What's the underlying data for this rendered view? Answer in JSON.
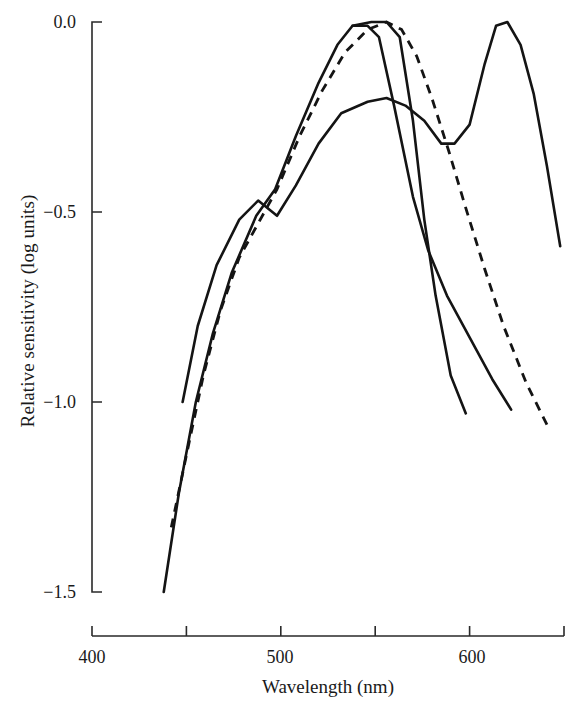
{
  "chart_data": {
    "type": "line",
    "title": "",
    "xlabel": "Wavelength (nm)",
    "ylabel": "Relative sensitivity (log units)",
    "xlim": [
      400,
      650
    ],
    "ylim": [
      -1.5,
      0.0
    ],
    "grid": false,
    "legend": "none",
    "x_ticks": [
      {
        "value": 400,
        "label": "400",
        "major": true
      },
      {
        "value": 450,
        "label": "",
        "major": false
      },
      {
        "value": 500,
        "label": "500",
        "major": true
      },
      {
        "value": 550,
        "label": "",
        "major": false
      },
      {
        "value": 600,
        "label": "600",
        "major": true
      },
      {
        "value": 650,
        "label": "",
        "major": false
      }
    ],
    "y_ticks": [
      {
        "value": 0.0,
        "label": "0.0"
      },
      {
        "value": -0.5,
        "label": "−0.5"
      },
      {
        "value": -1.0,
        "label": "−1.0"
      },
      {
        "value": -1.5,
        "label": "−1.5"
      }
    ],
    "series": [
      {
        "name": "short-wavelength-curve",
        "style": "solid",
        "color": "#141414",
        "points": [
          [
            438,
            -1.5
          ],
          [
            446,
            -1.24
          ],
          [
            455,
            -1.0
          ],
          [
            464,
            -0.82
          ],
          [
            474,
            -0.66
          ],
          [
            487,
            -0.51
          ],
          [
            497,
            -0.44
          ],
          [
            508,
            -0.3
          ],
          [
            520,
            -0.16
          ],
          [
            530,
            -0.06
          ],
          [
            538,
            -0.01
          ],
          [
            548,
            0.0
          ],
          [
            556,
            0.0
          ],
          [
            563,
            -0.04
          ],
          [
            570,
            -0.26
          ],
          [
            576,
            -0.52
          ],
          [
            582,
            -0.72
          ],
          [
            590,
            -0.93
          ],
          [
            598,
            -1.03
          ]
        ]
      },
      {
        "name": "middle-wavelength-curve",
        "style": "solid",
        "color": "#141414",
        "points": [
          [
            448,
            -1.0
          ],
          [
            456,
            -0.8
          ],
          [
            466,
            -0.64
          ],
          [
            478,
            -0.52
          ],
          [
            488,
            -0.47
          ],
          [
            498,
            -0.51
          ],
          [
            508,
            -0.43
          ],
          [
            520,
            -0.32
          ],
          [
            532,
            -0.24
          ],
          [
            546,
            -0.21
          ],
          [
            556,
            -0.2
          ],
          [
            566,
            -0.22
          ],
          [
            576,
            -0.26
          ],
          [
            585,
            -0.32
          ],
          [
            592,
            -0.32
          ],
          [
            600,
            -0.27
          ],
          [
            608,
            -0.11
          ],
          [
            614,
            -0.01
          ],
          [
            620,
            0.0
          ],
          [
            627,
            -0.06
          ],
          [
            634,
            -0.19
          ],
          [
            641,
            -0.38
          ],
          [
            648,
            -0.59
          ]
        ]
      },
      {
        "name": "long-wavelength-curve",
        "style": "solid",
        "color": "#141414",
        "points": [
          [
            538,
            -0.01
          ],
          [
            546,
            -0.01
          ],
          [
            552,
            -0.04
          ],
          [
            560,
            -0.22
          ],
          [
            570,
            -0.46
          ],
          [
            578,
            -0.6
          ],
          [
            588,
            -0.72
          ],
          [
            600,
            -0.83
          ],
          [
            612,
            -0.94
          ],
          [
            622,
            -1.02
          ]
        ]
      },
      {
        "name": "dashed-reference-curve",
        "style": "dashed",
        "color": "#141414",
        "points": [
          [
            442,
            -1.33
          ],
          [
            450,
            -1.14
          ],
          [
            459,
            -0.93
          ],
          [
            468,
            -0.76
          ],
          [
            478,
            -0.62
          ],
          [
            488,
            -0.53
          ],
          [
            498,
            -0.44
          ],
          [
            510,
            -0.3
          ],
          [
            522,
            -0.18
          ],
          [
            534,
            -0.08
          ],
          [
            546,
            -0.02
          ],
          [
            556,
            0.0
          ],
          [
            564,
            -0.02
          ],
          [
            572,
            -0.09
          ],
          [
            580,
            -0.2
          ],
          [
            589,
            -0.34
          ],
          [
            598,
            -0.49
          ],
          [
            608,
            -0.65
          ],
          [
            618,
            -0.8
          ],
          [
            630,
            -0.95
          ],
          [
            642,
            -1.07
          ]
        ]
      }
    ]
  }
}
